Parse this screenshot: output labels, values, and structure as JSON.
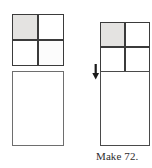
{
  "caption": {
    "text": "Make 72."
  },
  "colors": {
    "background": "#ffffff",
    "shaded_cell": "#e4e3e1",
    "empty_cell": "#ffffff",
    "outline_dark": "#3b3b3b",
    "outline_medium": "#6e6e6e",
    "arrow": "#1a1a1a",
    "caption_text": "#2d2d2d"
  },
  "figures": {
    "left": {
      "label": "separated-figure",
      "square": {
        "label": "partitioned-square",
        "rows": 2,
        "columns": 2,
        "total_cells": 4,
        "shaded_cells": 1,
        "cells": [
          {
            "position": "top-left",
            "state": "shaded"
          },
          {
            "position": "top-right",
            "state": "empty"
          },
          {
            "position": "bottom-left",
            "state": "empty"
          },
          {
            "position": "bottom-right",
            "state": "empty"
          }
        ]
      },
      "rectangle": {
        "label": "blank-rectangle",
        "state": "empty",
        "partitions": 0
      },
      "arrangement": "detached"
    },
    "right": {
      "label": "joined-figure",
      "square": {
        "label": "partitioned-square",
        "rows": 2,
        "columns": 2,
        "total_cells": 4,
        "shaded_cells": 1,
        "cells": [
          {
            "position": "top-left",
            "state": "shaded"
          },
          {
            "position": "top-right",
            "state": "empty"
          },
          {
            "position": "bottom-left",
            "state": "empty"
          },
          {
            "position": "bottom-right",
            "state": "empty"
          }
        ]
      },
      "rectangle": {
        "label": "blank-rectangle",
        "state": "empty",
        "partitions": 0
      },
      "arrangement": "attached"
    }
  },
  "arrow": {
    "label": "down-arrow",
    "direction": "down",
    "meaning": "move-down-to-join"
  }
}
